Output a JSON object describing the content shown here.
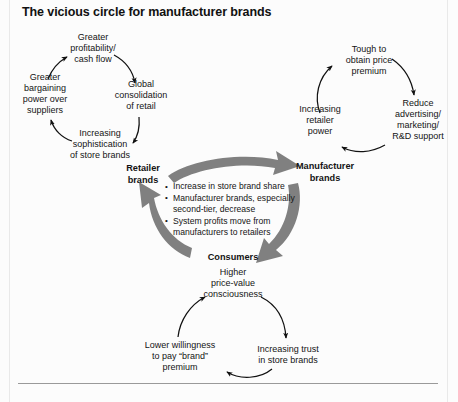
{
  "title": "The vicious circle for manufacturer brands",
  "colors": {
    "text": "#141414",
    "arrow_thin": "#111111",
    "arrow_thick": "#808080",
    "background": "#fcfcfc",
    "frame": "#9a9a9a"
  },
  "core_cycle": {
    "nodes": [
      {
        "id": "retailer-brands",
        "label": "Retailer\nbrands"
      },
      {
        "id": "manufacturer-brands",
        "label": "Manufacturer\nbrands"
      },
      {
        "id": "consumers",
        "label": "Consumers"
      }
    ],
    "bullets": [
      "Increase in store brand share",
      "Manufacturer brands, especially second-tier, decrease",
      "System profits move from manufacturers to retailers"
    ],
    "flow": [
      {
        "from": "retailer-brands",
        "to": "manufacturer-brands"
      },
      {
        "from": "manufacturer-brands",
        "to": "consumers"
      },
      {
        "from": "consumers",
        "to": "retailer-brands"
      }
    ]
  },
  "retailer_loop": {
    "name": "retailer-brands-loop",
    "nodes": [
      {
        "id": "greater-profitability",
        "label": "Greater\nprofitability/\ncash flow"
      },
      {
        "id": "global-consolidation",
        "label": "Global\nconsolidation\nof retail"
      },
      {
        "id": "increasing-sophistication",
        "label": "Increasing\nsophistication\nof store brands"
      },
      {
        "id": "greater-bargaining-power",
        "label": "Greater\nbargaining\npower over\nsuppliers"
      }
    ],
    "flow": [
      {
        "from": "greater-profitability",
        "to": "global-consolidation"
      },
      {
        "from": "global-consolidation",
        "to": "increasing-sophistication"
      },
      {
        "from": "increasing-sophistication",
        "to": "greater-bargaining-power"
      },
      {
        "from": "greater-bargaining-power",
        "to": "greater-profitability"
      }
    ]
  },
  "manufacturer_loop": {
    "name": "manufacturer-brands-loop",
    "nodes": [
      {
        "id": "tough-to-obtain-price-premium",
        "label": "Tough to\nobtain price\npremium"
      },
      {
        "id": "reduce-advertising",
        "label": "Reduce\nadvertising/\nmarketing/\nR&D support"
      },
      {
        "id": "increasing-retailer-power",
        "label": "Increasing\nretailer\npower"
      }
    ],
    "flow": [
      {
        "from": "tough-to-obtain-price-premium",
        "to": "reduce-advertising"
      },
      {
        "from": "reduce-advertising",
        "to": "increasing-retailer-power"
      },
      {
        "from": "increasing-retailer-power",
        "to": "tough-to-obtain-price-premium"
      }
    ]
  },
  "consumer_loop": {
    "name": "consumers-loop",
    "nodes": [
      {
        "id": "higher-price-value-consciousness",
        "label": "Higher\nprice-value\nconsciousness"
      },
      {
        "id": "increasing-trust-in-store-brands",
        "label": "Increasing trust\nin store brands"
      },
      {
        "id": "lower-willingness-to-pay",
        "label": "Lower willingness\nto pay “brand”\npremium"
      }
    ],
    "flow": [
      {
        "from": "higher-price-value-consciousness",
        "to": "increasing-trust-in-store-brands"
      },
      {
        "from": "increasing-trust-in-store-brands",
        "to": "lower-willingness-to-pay"
      },
      {
        "from": "lower-willingness-to-pay",
        "to": "higher-price-value-consciousness"
      }
    ]
  }
}
